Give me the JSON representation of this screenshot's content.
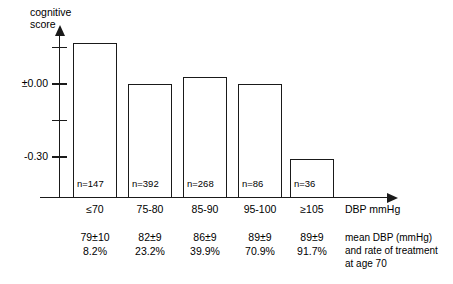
{
  "chart_data": {
    "type": "bar",
    "title": "",
    "ylabel": "cognitive score",
    "xlabel": "DBP mmHg",
    "categories": [
      "≤70",
      "75-80",
      "85-90",
      "95-100",
      "≥105"
    ],
    "values": [
      0.17,
      0.0,
      0.03,
      0.0,
      -0.31
    ],
    "counts": [
      "n=147",
      "n=392",
      "n=268",
      "n=86",
      "n=36"
    ],
    "ylim": [
      -0.45,
      0.22
    ],
    "yticks": [
      0.15,
      0.0,
      -0.15,
      -0.3
    ],
    "ytick_labels": [
      "",
      "±0.00",
      "",
      "-0.30"
    ],
    "grid": false,
    "legend": "none",
    "annotations": {
      "mean_dbp": [
        "79±10",
        "82±9",
        "86±9",
        "89±9",
        "89±9"
      ],
      "treatment_rate": [
        "8.2%",
        "23.2%",
        "39.9%",
        "70.9%",
        "91.7%"
      ],
      "caption_lines": [
        "mean DBP (mmHg)",
        "and rate of treatment",
        "at age 70"
      ]
    },
    "colors": {
      "bar_fill": "#ffffff",
      "bar_stroke": "#1a1a1a",
      "axis": "#1a1a1a",
      "text": "#000000"
    }
  },
  "axis": {
    "y_title_line1": "cognitive",
    "y_title_line2": "score",
    "x_title": "DBP mmHg"
  }
}
